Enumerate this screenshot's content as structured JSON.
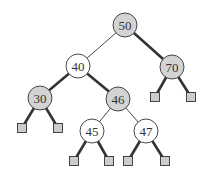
{
  "diagram": {
    "type": "red-black-tree",
    "colors": {
      "black_fill": "#d3d3d3",
      "red_fill": "#ffffff",
      "stroke": "#333333",
      "leaf_fill": "#cccccc"
    },
    "nodes": [
      {
        "id": "n50",
        "label": "50",
        "x": 125,
        "y": 25,
        "color": "black"
      },
      {
        "id": "n40",
        "label": "40",
        "x": 78,
        "y": 66,
        "color": "red"
      },
      {
        "id": "n70",
        "label": "70",
        "x": 172,
        "y": 67,
        "color": "black"
      },
      {
        "id": "n30",
        "label": "30",
        "x": 40,
        "y": 98,
        "color": "black"
      },
      {
        "id": "n46",
        "label": "46",
        "x": 118,
        "y": 99,
        "color": "black"
      },
      {
        "id": "n45",
        "label": "45",
        "x": 92,
        "y": 131,
        "color": "red"
      },
      {
        "id": "n47",
        "label": "47",
        "x": 146,
        "y": 131,
        "color": "red"
      }
    ],
    "leaves": [
      {
        "parent": "n70",
        "x": 155,
        "y": 97
      },
      {
        "parent": "n70",
        "x": 191,
        "y": 97
      },
      {
        "parent": "n30",
        "x": 22,
        "y": 128
      },
      {
        "parent": "n30",
        "x": 58,
        "y": 128
      },
      {
        "parent": "n45",
        "x": 74,
        "y": 161
      },
      {
        "parent": "n45",
        "x": 109,
        "y": 161
      },
      {
        "parent": "n47",
        "x": 128,
        "y": 161
      },
      {
        "parent": "n47",
        "x": 165,
        "y": 161
      }
    ],
    "edges": [
      {
        "from": "n50",
        "to": "n40",
        "thick": false
      },
      {
        "from": "n50",
        "to": "n70",
        "thick": true
      },
      {
        "from": "n40",
        "to": "n30",
        "thick": true
      },
      {
        "from": "n40",
        "to": "n46",
        "thick": true
      },
      {
        "from": "n46",
        "to": "n45",
        "thick": false
      },
      {
        "from": "n46",
        "to": "n47",
        "thick": false
      }
    ]
  }
}
